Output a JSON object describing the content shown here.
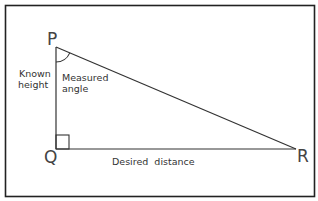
{
  "diagram": {
    "type": "right-triangle",
    "vertices": {
      "P": "P",
      "Q": "Q",
      "R": "R"
    },
    "labels": {
      "known_height_line1": "Known",
      "known_height_line2": "height",
      "measured_angle_line1": "Measured",
      "measured_angle_line2": "angle",
      "desired_distance": "Desired  distance"
    },
    "colors": {
      "stroke": "#333333",
      "frame": "#222222",
      "background": "#ffffff"
    }
  }
}
